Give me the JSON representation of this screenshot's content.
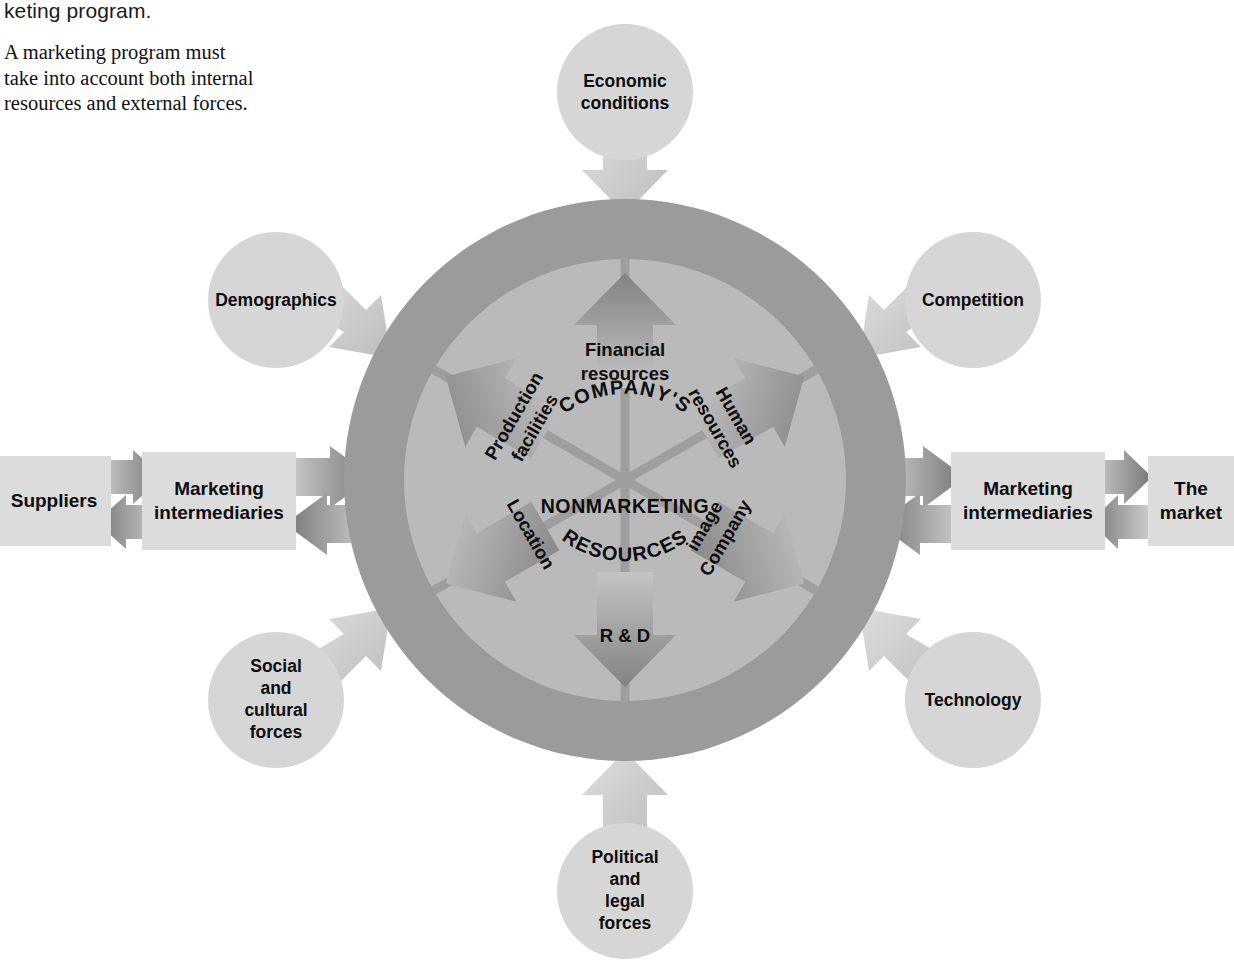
{
  "caption": {
    "cut_line": "keting program.",
    "body": "A marketing program must take into account both internal resources and external forces."
  },
  "figure": {
    "center_text": {
      "line1": "COMPANY'S",
      "line2": "NONMARKETING",
      "line3": "RESOURCES"
    },
    "wheel_segments": [
      {
        "id": "financial-resources",
        "label_line1": "Financial",
        "label_line2": "resources",
        "arrow": "up"
      },
      {
        "id": "human-resources",
        "label_line1": "Human",
        "label_line2": "resources",
        "arrow": "up-right"
      },
      {
        "id": "company-image",
        "label_line1": "Company",
        "label_line2": "image",
        "arrow": "down-right"
      },
      {
        "id": "r-and-d",
        "label_line1": "R & D",
        "label_line2": "",
        "arrow": "down"
      },
      {
        "id": "location",
        "label_line1": "Location",
        "label_line2": "",
        "arrow": "down-left"
      },
      {
        "id": "production-facilities",
        "label_line1": "Production",
        "label_line2": "facilities",
        "arrow": "up-left"
      }
    ],
    "external_forces": [
      {
        "id": "economic-conditions",
        "lines": [
          "Economic",
          "conditions"
        ],
        "position": "top"
      },
      {
        "id": "demographics",
        "lines": [
          "Demographics"
        ],
        "position": "top-left"
      },
      {
        "id": "competition",
        "lines": [
          "Competition"
        ],
        "position": "top-right"
      },
      {
        "id": "social-cultural-forces",
        "lines": [
          "Social",
          "and",
          "cultural",
          "forces"
        ],
        "position": "bottom-left"
      },
      {
        "id": "technology",
        "lines": [
          "Technology"
        ],
        "position": "bottom-right"
      },
      {
        "id": "political-legal-forces",
        "lines": [
          "Political",
          "and",
          "legal",
          "forces"
        ],
        "position": "bottom"
      }
    ],
    "flow_boxes": [
      {
        "id": "suppliers",
        "lines": [
          "Suppliers"
        ],
        "side": "left-outer"
      },
      {
        "id": "marketing-intermediaries-left",
        "lines": [
          "Marketing",
          "intermediaries"
        ],
        "side": "left-inner"
      },
      {
        "id": "marketing-intermediaries-right",
        "lines": [
          "Marketing",
          "intermediaries"
        ],
        "side": "right-inner"
      },
      {
        "id": "the-market",
        "lines": [
          "The",
          "market"
        ],
        "side": "right-outer"
      }
    ],
    "colors": {
      "outer_ring": "#9b9b9b",
      "inner_wheel": "#b9b9b9",
      "satellite": "#d6d6d6",
      "box_fill": "#dcdcdc",
      "arrow_dark": "#8d8d8d",
      "arrow_light": "#c9c9c9",
      "divider": "#9e9e9e",
      "text": "#0d0d0d",
      "page_bg": "#ffffff"
    }
  }
}
